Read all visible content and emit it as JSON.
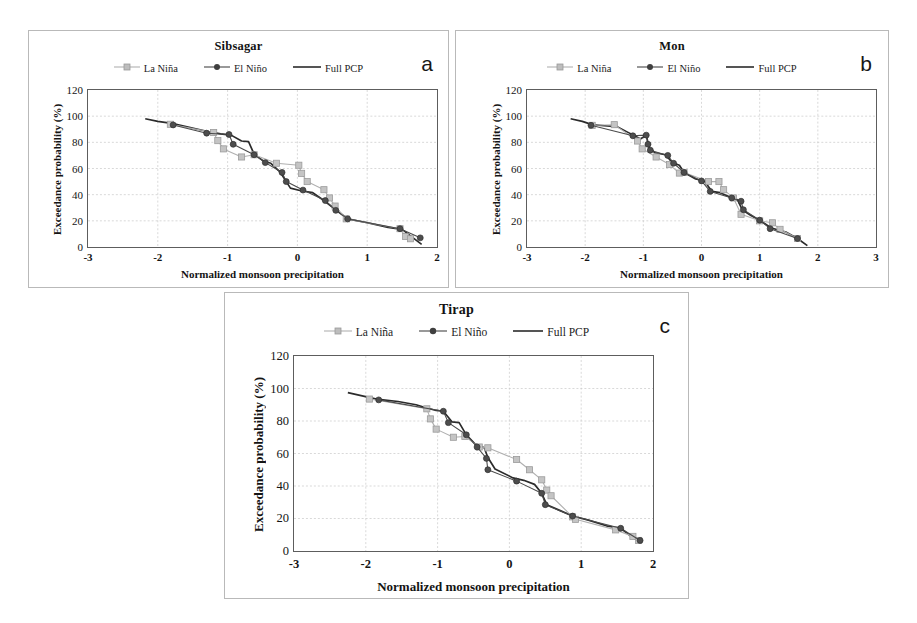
{
  "figure": {
    "panels": [
      {
        "letter": "a",
        "title": "Sibsagar",
        "xlabel": "Normalized monsoon  precipitation",
        "ylabel": "Exceedance probability (%)",
        "legend": [
          {
            "label": "La Niña",
            "key": "line-marker-square",
            "color": "#b0b0b0"
          },
          {
            "label": "El Niño",
            "key": "line-marker-circle",
            "color": "#4a4a4a"
          },
          {
            "label": "Full PCP",
            "key": "line-plain",
            "color": "#2b2b2b"
          }
        ],
        "xticks": [
          "-3",
          "-2",
          "-1",
          "0",
          "1",
          "2"
        ],
        "yticks": [
          "0",
          "20",
          "40",
          "60",
          "80",
          "100",
          "120"
        ]
      },
      {
        "letter": "b",
        "title": "Mon",
        "xlabel": "Normalized monsoon  precipitation",
        "ylabel": "Exceedance probability (%)",
        "legend": [
          {
            "label": "La Niña",
            "key": "line-marker-square",
            "color": "#b0b0b0"
          },
          {
            "label": "El Niño",
            "key": "line-marker-circle",
            "color": "#4a4a4a"
          },
          {
            "label": "Full PCP",
            "key": "line-plain",
            "color": "#2b2b2b"
          }
        ],
        "xticks": [
          "-3",
          "-2",
          "-1",
          "0",
          "1",
          "2",
          "3"
        ],
        "yticks": [
          "0",
          "20",
          "40",
          "60",
          "80",
          "100",
          "120"
        ]
      },
      {
        "letter": "c",
        "title": "Tirap",
        "xlabel": "Normalized monsoon  precipitation",
        "ylabel": "Exceedance probability (%)",
        "legend": [
          {
            "label": "La Niña",
            "key": "line-marker-square",
            "color": "#b0b0b0"
          },
          {
            "label": "El Niño",
            "key": "line-marker-circle",
            "color": "#4a4a4a"
          },
          {
            "label": "Full PCP",
            "key": "line-plain",
            "color": "#2b2b2b"
          }
        ],
        "xticks": [
          "-3",
          "-2",
          "-1",
          "0",
          "1",
          "2"
        ],
        "yticks": [
          "0",
          "20",
          "40",
          "60",
          "80",
          "100",
          "120"
        ]
      }
    ]
  },
  "chart_data": [
    {
      "type": "line",
      "title": "Sibsagar",
      "panel": "a",
      "xlabel": "Normalized monsoon  precipitation",
      "ylabel": "Exceedance probability (%)",
      "xlim": [
        -3,
        2
      ],
      "ylim": [
        0,
        120
      ],
      "xticks": [
        -3,
        -2,
        -1,
        0,
        1,
        2
      ],
      "yticks": [
        0,
        20,
        40,
        60,
        80,
        100,
        120
      ],
      "grid": true,
      "legend_position": "top-center",
      "series": [
        {
          "name": "La Niña",
          "marker": "square",
          "color": "#b0b0b0",
          "points": [
            [
              -1.82,
              93.8
            ],
            [
              -1.2,
              87.5
            ],
            [
              -1.14,
              81.3
            ],
            [
              -1.06,
              75.0
            ],
            [
              -0.8,
              68.8
            ],
            [
              -0.62,
              70.5
            ],
            [
              -0.3,
              64.0
            ],
            [
              0.02,
              62.5
            ],
            [
              0.06,
              56.3
            ],
            [
              0.14,
              50.0
            ],
            [
              0.38,
              43.8
            ],
            [
              0.46,
              37.5
            ],
            [
              0.54,
              31.3
            ],
            [
              0.7,
              21.5
            ],
            [
              1.47,
              14.0
            ],
            [
              1.55,
              8.0
            ],
            [
              1.62,
              6.3
            ]
          ]
        },
        {
          "name": "El Niño",
          "marker": "circle",
          "color": "#4a4a4a",
          "points": [
            [
              -1.78,
              93.3
            ],
            [
              -1.3,
              87.0
            ],
            [
              -0.98,
              86.0
            ],
            [
              -0.92,
              78.5
            ],
            [
              -0.62,
              70.5
            ],
            [
              -0.46,
              64.5
            ],
            [
              -0.22,
              57.0
            ],
            [
              -0.16,
              50.0
            ],
            [
              0.08,
              43.5
            ],
            [
              0.4,
              35.5
            ],
            [
              0.55,
              28.0
            ],
            [
              0.72,
              21.5
            ],
            [
              1.47,
              14.0
            ],
            [
              1.76,
              7.0
            ]
          ]
        },
        {
          "name": "Full PCP",
          "marker": "none",
          "color": "#2b2b2b",
          "points": [
            [
              -2.18,
              98.0
            ],
            [
              -2.0,
              96.0
            ],
            [
              -1.8,
              94.5
            ],
            [
              -1.55,
              91.5
            ],
            [
              -1.3,
              88.5
            ],
            [
              -1.1,
              86.5
            ],
            [
              -0.95,
              85.5
            ],
            [
              -0.8,
              81.0
            ],
            [
              -0.7,
              80.5
            ],
            [
              -0.62,
              71.0
            ],
            [
              -0.48,
              65.5
            ],
            [
              -0.38,
              64.0
            ],
            [
              -0.25,
              57.5
            ],
            [
              -0.1,
              45.0
            ],
            [
              0.05,
              43.0
            ],
            [
              0.22,
              41.5
            ],
            [
              0.38,
              35.5
            ],
            [
              0.55,
              28.5
            ],
            [
              0.72,
              21.5
            ],
            [
              1.0,
              18.5
            ],
            [
              1.3,
              15.0
            ],
            [
              1.5,
              13.5
            ],
            [
              1.62,
              8.5
            ],
            [
              1.78,
              2.0
            ]
          ]
        }
      ]
    },
    {
      "type": "line",
      "title": "Mon",
      "panel": "b",
      "xlabel": "Normalized monsoon  precipitation",
      "ylabel": "Exceedance probability (%)",
      "xlim": [
        -3,
        3
      ],
      "ylim": [
        0,
        120
      ],
      "xticks": [
        -3,
        -2,
        -1,
        0,
        1,
        2,
        3
      ],
      "yticks": [
        0,
        20,
        40,
        60,
        80,
        100,
        120
      ],
      "grid": true,
      "legend_position": "top-center",
      "series": [
        {
          "name": "La Niña",
          "marker": "square",
          "color": "#b0b0b0",
          "points": [
            [
              -1.88,
              93.0
            ],
            [
              -1.5,
              93.5
            ],
            [
              -1.1,
              81.0
            ],
            [
              -1.02,
              75.0
            ],
            [
              -0.78,
              68.8
            ],
            [
              -0.55,
              63.0
            ],
            [
              -0.38,
              56.5
            ],
            [
              -0.3,
              57.0
            ],
            [
              0.12,
              50.0
            ],
            [
              0.3,
              50.0
            ],
            [
              0.38,
              43.8
            ],
            [
              0.55,
              37.5
            ],
            [
              0.68,
              25.0
            ],
            [
              1.0,
              20.0
            ],
            [
              1.22,
              18.5
            ],
            [
              1.35,
              13.5
            ],
            [
              1.65,
              6.5
            ]
          ]
        },
        {
          "name": "El Niño",
          "marker": "circle",
          "color": "#4a4a4a",
          "points": [
            [
              -1.9,
              93.0
            ],
            [
              -1.18,
              85.0
            ],
            [
              -0.95,
              85.5
            ],
            [
              -0.92,
              78.5
            ],
            [
              -0.88,
              74.0
            ],
            [
              -0.58,
              70.0
            ],
            [
              -0.48,
              64.0
            ],
            [
              -0.3,
              57.0
            ],
            [
              0.0,
              50.5
            ],
            [
              0.15,
              42.5
            ],
            [
              0.52,
              37.5
            ],
            [
              0.68,
              35.0
            ],
            [
              0.72,
              28.5
            ],
            [
              1.0,
              20.5
            ],
            [
              1.18,
              14.0
            ],
            [
              1.65,
              6.5
            ]
          ]
        },
        {
          "name": "Full PCP",
          "marker": "none",
          "color": "#2b2b2b",
          "points": [
            [
              -2.25,
              98.0
            ],
            [
              -2.05,
              96.0
            ],
            [
              -1.88,
              93.5
            ],
            [
              -1.62,
              92.5
            ],
            [
              -1.45,
              92.0
            ],
            [
              -1.28,
              88.0
            ],
            [
              -1.15,
              85.0
            ],
            [
              -1.05,
              82.5
            ],
            [
              -0.95,
              85.5
            ],
            [
              -0.9,
              76.0
            ],
            [
              -0.8,
              72.0
            ],
            [
              -0.62,
              70.5
            ],
            [
              -0.5,
              64.5
            ],
            [
              -0.38,
              62.5
            ],
            [
              -0.3,
              57.0
            ],
            [
              -0.1,
              52.0
            ],
            [
              0.05,
              50.5
            ],
            [
              0.18,
              42.5
            ],
            [
              0.32,
              41.5
            ],
            [
              0.5,
              38.0
            ],
            [
              0.62,
              36.0
            ],
            [
              0.7,
              28.5
            ],
            [
              0.85,
              24.0
            ],
            [
              1.0,
              20.5
            ],
            [
              1.2,
              14.5
            ],
            [
              1.45,
              11.5
            ],
            [
              1.65,
              6.5
            ],
            [
              1.82,
              1.0
            ]
          ]
        }
      ]
    },
    {
      "type": "line",
      "title": "Tirap",
      "panel": "c",
      "xlabel": "Normalized monsoon  precipitation",
      "ylabel": "Exceedance probability (%)",
      "xlim": [
        -3,
        2
      ],
      "ylim": [
        0,
        120
      ],
      "xticks": [
        -3,
        -2,
        -1,
        0,
        1,
        2
      ],
      "yticks": [
        0,
        20,
        40,
        60,
        80,
        100,
        120
      ],
      "grid": true,
      "legend_position": "top-center",
      "series": [
        {
          "name": "La Niña",
          "marker": "square",
          "color": "#b0b0b0",
          "points": [
            [
              -1.95,
              93.5
            ],
            [
              -1.15,
              87.5
            ],
            [
              -1.1,
              81.3
            ],
            [
              -1.02,
              75.0
            ],
            [
              -0.78,
              70.0
            ],
            [
              -0.62,
              70.5
            ],
            [
              -0.42,
              64.0
            ],
            [
              -0.3,
              63.5
            ],
            [
              0.1,
              56.3
            ],
            [
              0.28,
              50.0
            ],
            [
              0.45,
              43.8
            ],
            [
              0.52,
              37.5
            ],
            [
              0.58,
              34.0
            ],
            [
              0.88,
              21.0
            ],
            [
              0.92,
              19.5
            ],
            [
              1.48,
              13.0
            ],
            [
              1.72,
              9.0
            ],
            [
              1.8,
              6.5
            ]
          ]
        },
        {
          "name": "El Niño",
          "marker": "circle",
          "color": "#4a4a4a",
          "points": [
            [
              -1.82,
              93.0
            ],
            [
              -0.92,
              86.0
            ],
            [
              -0.85,
              79.0
            ],
            [
              -0.6,
              71.5
            ],
            [
              -0.45,
              64.0
            ],
            [
              -0.32,
              57.0
            ],
            [
              -0.3,
              50.0
            ],
            [
              0.1,
              43.0
            ],
            [
              0.45,
              35.5
            ],
            [
              0.5,
              28.5
            ],
            [
              0.88,
              21.5
            ],
            [
              1.55,
              14.0
            ],
            [
              1.82,
              6.5
            ]
          ]
        },
        {
          "name": "Full PCP",
          "marker": "none",
          "color": "#2b2b2b",
          "points": [
            [
              -2.25,
              97.5
            ],
            [
              -2.05,
              95.5
            ],
            [
              -1.85,
              93.5
            ],
            [
              -1.55,
              92.0
            ],
            [
              -1.3,
              90.0
            ],
            [
              -1.15,
              88.0
            ],
            [
              -1.02,
              86.5
            ],
            [
              -0.92,
              86.0
            ],
            [
              -0.8,
              79.5
            ],
            [
              -0.7,
              79.0
            ],
            [
              -0.6,
              71.5
            ],
            [
              -0.48,
              66.0
            ],
            [
              -0.35,
              63.5
            ],
            [
              -0.3,
              57.5
            ],
            [
              -0.2,
              50.5
            ],
            [
              0.05,
              45.0
            ],
            [
              0.2,
              43.5
            ],
            [
              0.35,
              41.0
            ],
            [
              0.45,
              35.5
            ],
            [
              0.52,
              28.5
            ],
            [
              0.7,
              25.0
            ],
            [
              0.88,
              21.5
            ],
            [
              1.1,
              19.0
            ],
            [
              1.35,
              15.5
            ],
            [
              1.55,
              14.0
            ],
            [
              1.68,
              9.5
            ],
            [
              1.82,
              5.5
            ]
          ]
        }
      ]
    }
  ]
}
